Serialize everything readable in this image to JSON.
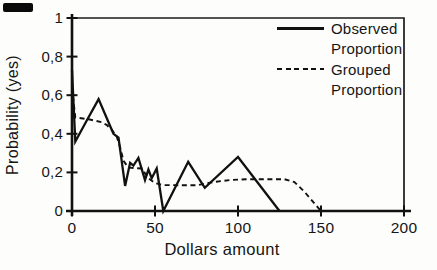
{
  "figure": {
    "background": "#fdfdfc",
    "ink_color": "#111111",
    "scan_artifact_present": true
  },
  "chart_data": {
    "type": "line",
    "title": "",
    "xlabel": "Dollars amount",
    "ylabel": "Probability (yes)",
    "xlim": [
      0,
      200
    ],
    "ylim": [
      0,
      1
    ],
    "grid": false,
    "legend_position": "top-right-inside",
    "x_ticks": [
      {
        "value": 0,
        "label": "0"
      },
      {
        "value": 50,
        "label": "50"
      },
      {
        "value": 100,
        "label": "100"
      },
      {
        "value": 150,
        "label": "150"
      },
      {
        "value": 200,
        "label": "200"
      }
    ],
    "y_ticks": [
      {
        "value": 0,
        "label": "0"
      },
      {
        "value": 0.2,
        "label": "0,2"
      },
      {
        "value": 0.4,
        "label": "0,4"
      },
      {
        "value": 0.6,
        "label": "0,6"
      },
      {
        "value": 0.8,
        "label": "0,8"
      },
      {
        "value": 1,
        "label": "1"
      }
    ],
    "series": [
      {
        "name": "Observed Proportion",
        "style": "solid",
        "points": [
          [
            0,
            0.73
          ],
          [
            2,
            0.36
          ],
          [
            9,
            0.47
          ],
          [
            16,
            0.58
          ],
          [
            22,
            0.46
          ],
          [
            25,
            0.4
          ],
          [
            28,
            0.38
          ],
          [
            32,
            0.13
          ],
          [
            35,
            0.25
          ],
          [
            37,
            0.235
          ],
          [
            40,
            0.275
          ],
          [
            44,
            0.16
          ],
          [
            46,
            0.215
          ],
          [
            48,
            0.17
          ],
          [
            51,
            0.22
          ],
          [
            55,
            0
          ],
          [
            70,
            0.255
          ],
          [
            80,
            0.12
          ],
          [
            100,
            0.28
          ],
          [
            125,
            0
          ]
        ]
      },
      {
        "name": "Grouped Proportion",
        "style": "dashed",
        "points": [
          [
            0,
            0.64
          ],
          [
            2,
            0.485
          ],
          [
            10,
            0.475
          ],
          [
            18,
            0.46
          ],
          [
            21,
            0.445
          ],
          [
            24,
            0.42
          ],
          [
            27,
            0.385
          ],
          [
            29,
            0.33
          ],
          [
            31,
            0.26
          ],
          [
            34,
            0.225
          ],
          [
            42,
            0.22
          ],
          [
            46,
            0.17
          ],
          [
            50,
            0.145
          ],
          [
            55,
            0.134
          ],
          [
            75,
            0.133
          ],
          [
            85,
            0.15
          ],
          [
            95,
            0.16
          ],
          [
            105,
            0.165
          ],
          [
            128,
            0.165
          ],
          [
            134,
            0.15
          ],
          [
            140,
            0.1
          ],
          [
            146,
            0.04
          ],
          [
            150,
            0
          ]
        ]
      }
    ]
  }
}
